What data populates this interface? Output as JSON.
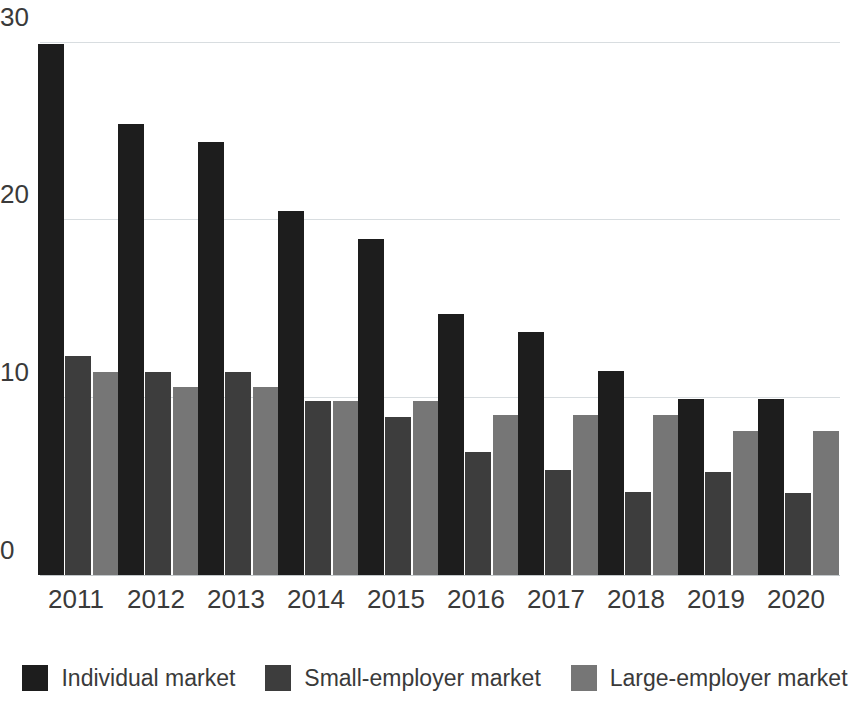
{
  "chart_data": {
    "type": "bar",
    "title": "",
    "subtitle": "",
    "xlabel": "",
    "ylabel": "",
    "categories": [
      "2011",
      "2012",
      "2013",
      "2014",
      "2015",
      "2016",
      "2017",
      "2018",
      "2019",
      "2020"
    ],
    "series": [
      {
        "name": "Individual market",
        "color": "#1d1d1d",
        "values": [
          29.9,
          25.4,
          24.4,
          20.5,
          18.9,
          14.7,
          13.7,
          11.5,
          9.9,
          9.9
        ]
      },
      {
        "name": "Small-employer market",
        "color": "#3d3d3d",
        "values": [
          12.3,
          11.4,
          11.4,
          9.8,
          8.9,
          6.9,
          5.9,
          4.7,
          5.8,
          4.6
        ]
      },
      {
        "name": "Large-employer market",
        "color": "#767676",
        "values": [
          11.4,
          10.6,
          10.6,
          9.8,
          9.8,
          9.0,
          9.0,
          9.0,
          8.1,
          8.1
        ]
      }
    ],
    "yticks": [
      0,
      10,
      20,
      30
    ],
    "ytick_labels": [
      "0",
      "10",
      "20",
      "30"
    ],
    "ylim": [
      0,
      30
    ],
    "grid": true,
    "legend_position": "bottom",
    "bar_group_layout": "grouped"
  },
  "axis": {
    "y_labels": [
      "30",
      "20",
      "10",
      "0"
    ]
  },
  "legend": {
    "items": [
      {
        "label": "Individual market",
        "swatch": "series-0-swatch"
      },
      {
        "label": "Small-employer market",
        "swatch": "series-1-swatch"
      },
      {
        "label": "Large-employer market",
        "swatch": "series-2-swatch"
      }
    ]
  }
}
